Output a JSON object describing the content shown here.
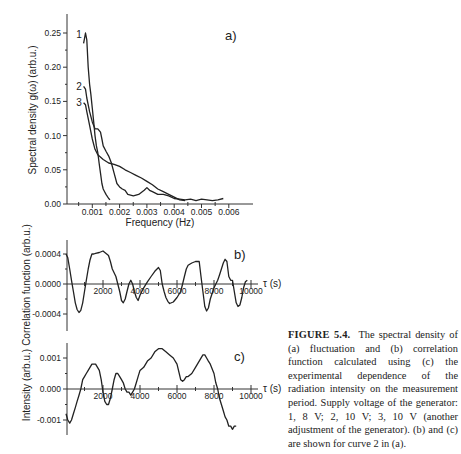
{
  "caption": {
    "label": "FIGURE 5.4.",
    "text": "The spectral density of (a) fluctuation and (b) correlation function calculated using (c) the experimental dependence of the radiation intensity on the measurement period. Supply voltage of the generator: 1, 8 V; 2, 10 V; 3, 10 V (another adjustment of the generator). (b) and (c) are shown for curve 2 in (a)."
  },
  "chart_data": [
    {
      "panel": "a)",
      "type": "line",
      "title": "",
      "xlabel": "Frequency (Hz)",
      "ylabel": "Spectral density  g(ω) (arb.u.)",
      "xlim": [
        0,
        0.0066
      ],
      "ylim": [
        0,
        0.27
      ],
      "xticks": [
        0.001,
        0.002,
        0.003,
        0.004,
        0.005,
        0.006
      ],
      "xtick_labels": [
        "0.001",
        "0.002",
        "0.003",
        "0.004",
        "0.005",
        "0.006"
      ],
      "yticks": [
        0,
        0.05,
        0.1,
        0.15,
        0.2,
        0.25
      ],
      "ytick_labels": [
        "0.00",
        "0.05",
        "0.10",
        "0.15",
        "0.20",
        "0.25"
      ],
      "grid": false,
      "series": [
        {
          "name": "1",
          "x": [
            0.00068,
            0.00075,
            0.0008,
            0.00085,
            0.0009,
            0.00095,
            0.001,
            0.00105,
            0.0011,
            0.00115,
            0.0012,
            0.00125,
            0.0013,
            0.00135,
            0.0014,
            0.00145,
            0.0015,
            0.0016,
            0.00165
          ],
          "y": [
            0.235,
            0.25,
            0.24,
            0.2,
            0.175,
            0.16,
            0.14,
            0.12,
            0.1,
            0.085,
            0.075,
            0.06,
            0.045,
            0.03,
            0.022,
            0.018,
            0.014,
            0.008,
            0.006
          ]
        },
        {
          "name": "2",
          "x": [
            0.00068,
            0.00075,
            0.0008,
            0.0009,
            0.001,
            0.0011,
            0.0012,
            0.0013,
            0.00135,
            0.0014,
            0.0015,
            0.0016,
            0.0017,
            0.0018,
            0.0019,
            0.002,
            0.0021,
            0.0022,
            0.0023,
            0.0025,
            0.0027,
            0.0029,
            0.003,
            0.0031,
            0.0032,
            0.0034,
            0.0036,
            0.0038,
            0.004,
            0.0042,
            0.0044,
            0.0046,
            0.0048,
            0.005,
            0.0052,
            0.0054,
            0.0056,
            0.0058
          ],
          "y": [
            0.172,
            0.168,
            0.155,
            0.135,
            0.12,
            0.11,
            0.11,
            0.105,
            0.095,
            0.085,
            0.077,
            0.07,
            0.06,
            0.045,
            0.03,
            0.025,
            0.022,
            0.02,
            0.014,
            0.012,
            0.014,
            0.02,
            0.024,
            0.02,
            0.018,
            0.014,
            0.014,
            0.012,
            0.008,
            0.007,
            0.006,
            0.007,
            0.005,
            0.007,
            0.006,
            0.005,
            0.006,
            0.008
          ]
        },
        {
          "name": "3",
          "x": [
            0.00068,
            0.00075,
            0.0008,
            0.0009,
            0.001,
            0.0011,
            0.0012,
            0.0014,
            0.0016,
            0.0018,
            0.002,
            0.0022,
            0.0024,
            0.0026,
            0.0028,
            0.003,
            0.0032,
            0.0034,
            0.0036,
            0.0038,
            0.004,
            0.0042,
            0.0044
          ],
          "y": [
            0.148,
            0.145,
            0.135,
            0.115,
            0.095,
            0.08,
            0.072,
            0.065,
            0.06,
            0.058,
            0.055,
            0.05,
            0.046,
            0.042,
            0.038,
            0.033,
            0.028,
            0.022,
            0.018,
            0.014,
            0.01,
            0.006,
            0.005
          ]
        }
      ]
    },
    {
      "panel": "b)",
      "type": "line",
      "xlabel": "τ (s)",
      "ylabel": "Correlation function (arb.u.)",
      "xlim": [
        0,
        10600
      ],
      "ylim": [
        -0.00052,
        0.00058
      ],
      "xticks": [
        2000,
        4000,
        6000,
        8000,
        10000
      ],
      "xtick_labels": [
        "2000",
        "4000",
        "6000",
        "8000",
        "10000"
      ],
      "yticks": [
        -0.0004,
        0,
        0.0004
      ],
      "ytick_labels": [
        "-0.0004",
        "0.0000",
        "0.0004"
      ],
      "grid": false,
      "series": [
        {
          "name": "2",
          "x": [
            0,
            100,
            200,
            300,
            400,
            500,
            600,
            700,
            800,
            900,
            1000,
            1100,
            1200,
            1300,
            1400,
            1500,
            1600,
            1800,
            2000,
            2200,
            2300,
            2400,
            2500,
            2600,
            2700,
            2800,
            2900,
            3000,
            3100,
            3200,
            3300,
            3400,
            3500,
            3600,
            3700,
            3800,
            3900,
            4000,
            4100,
            4200,
            4400,
            4600,
            4800,
            5000,
            5100,
            5200,
            5300,
            5400,
            5500,
            5600,
            5800,
            6000,
            6200,
            6300,
            6400,
            6500,
            6600,
            6800,
            7000,
            7100,
            7200,
            7300,
            7400,
            7500,
            7600,
            7700,
            7800,
            8000,
            8200,
            8300,
            8400,
            8500,
            8600,
            8700,
            8800,
            8900,
            9000,
            9100,
            9200,
            9300,
            9400,
            9500,
            9600,
            9700,
            9800
          ],
          "y": [
            0.0004,
            0.00035,
            0.0002,
            5e-05,
            -0.0001,
            -0.00025,
            -0.00034,
            -0.00038,
            -0.00035,
            -0.00025,
            -0.0001,
            5e-05,
            0.0002,
            0.00032,
            0.0004,
            0.0004,
            0.00041,
            0.00042,
            0.00044,
            0.0004,
            0.00038,
            0.0003,
            0.0002,
            0.00015,
            0.0001,
            0.0,
            -0.0001,
            -0.00022,
            -0.00025,
            -0.0002,
            -0.0001,
            0.0,
            5e-05,
            0.0,
            -0.0001,
            -0.00018,
            -0.00022,
            -0.00015,
            -0.0001,
            -5e-05,
            3e-05,
            0.0001,
            0.00017,
            0.00022,
            0.00018,
            0.0,
            -0.0001,
            -0.00018,
            -0.00023,
            -0.00026,
            -0.00024,
            -0.00018,
            -0.0001,
            0.0,
            0.0001,
            0.0002,
            0.00025,
            0.00028,
            0.0003,
            0.0003,
            0.0003,
            0.0001,
            -0.0001,
            -0.0003,
            -0.00036,
            -0.00032,
            -0.0002,
            -5e-05,
            5e-05,
            0.00012,
            0.0002,
            0.00028,
            0.00033,
            0.0003,
            0.0001,
            5e-05,
            5e-05,
            -0.0001,
            -0.00025,
            -0.0003,
            -0.00028,
            -0.00018,
            -5e-05,
            3e-05,
            5e-05
          ]
        }
      ]
    },
    {
      "panel": "c)",
      "type": "line",
      "xlabel": "τ (s)",
      "ylabel": "Intensity (arb.u.)",
      "xlim": [
        0,
        10600
      ],
      "ylim": [
        -0.0015,
        0.0015
      ],
      "xticks": [
        2000,
        4000,
        6000,
        8000,
        10000
      ],
      "xtick_labels": [
        "2000",
        "4000",
        "6000",
        "8000",
        "10000"
      ],
      "yticks": [
        -0.001,
        0,
        0.001
      ],
      "ytick_labels": [
        "-0.001",
        "0.000",
        "0.001"
      ],
      "grid": false,
      "series": [
        {
          "name": "2",
          "x": [
            0,
            100,
            200,
            300,
            400,
            500,
            600,
            700,
            800,
            900,
            1000,
            1100,
            1200,
            1400,
            1600,
            1800,
            1900,
            2000,
            2100,
            2200,
            2300,
            2400,
            2500,
            2600,
            2700,
            2800,
            2900,
            3000,
            3100,
            3200,
            3300,
            3400,
            3500,
            3600,
            3700,
            3800,
            3900,
            4000,
            4200,
            4400,
            4600,
            4800,
            5000,
            5200,
            5400,
            5600,
            5800,
            6000,
            6200,
            6300,
            6400,
            6500,
            6600,
            6800,
            7000,
            7200,
            7400,
            7500,
            7600,
            7700,
            7800,
            8000,
            8100,
            8200,
            8300,
            8400,
            8500,
            8600,
            8700,
            8800,
            8900,
            9000,
            9100,
            9200
          ],
          "y": [
            -0.0008,
            -0.001,
            -0.0011,
            -0.001,
            -0.0008,
            -0.0006,
            -0.0004,
            -0.0002,
            0.0,
            0.0003,
            0.0004,
            0.0005,
            0.0006,
            0.0008,
            0.0008,
            0.0006,
            0.0003,
            -0.0001,
            -0.0004,
            -0.0005,
            -0.0005,
            -0.0003,
            0.0,
            0.0003,
            0.0005,
            0.0005,
            0.0004,
            0.0003,
            0.0002,
            0.0,
            -0.0001,
            -0.0001,
            -0.0002,
            -0.0001,
            0.0,
            0.0002,
            0.0004,
            0.0006,
            0.0007,
            0.0009,
            0.001,
            0.0012,
            0.0013,
            0.0013,
            0.0012,
            0.0011,
            0.001,
            0.0008,
            0.0003,
            0.00025,
            0.0003,
            0.0004,
            0.0004,
            0.0005,
            0.0007,
            0.0009,
            0.0011,
            0.0011,
            0.001,
            0.0009,
            0.0008,
            0.0005,
            0.0002,
            0.0,
            -0.0003,
            -0.0005,
            -0.0007,
            -0.0009,
            -0.001,
            -0.0012,
            -0.0012,
            -0.0013,
            -0.0012,
            -0.0012
          ]
        }
      ]
    }
  ]
}
